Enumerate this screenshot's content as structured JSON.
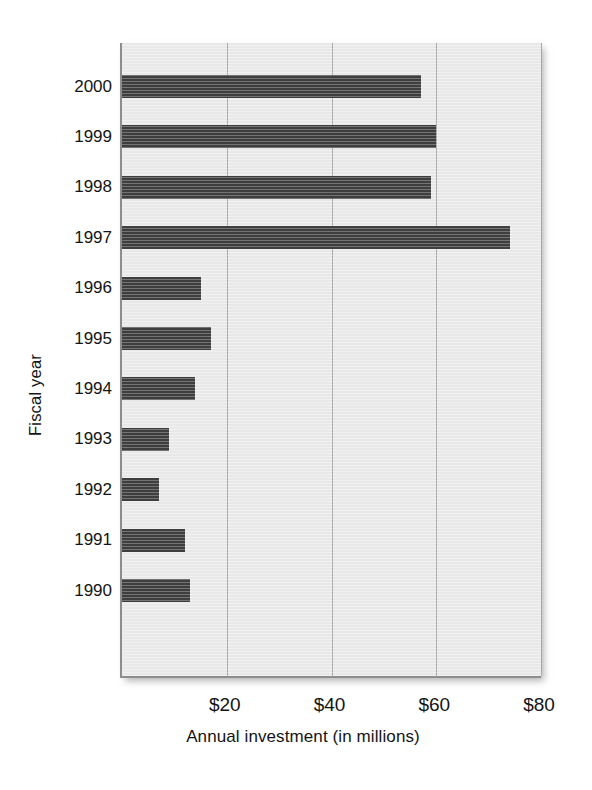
{
  "chart_data": {
    "type": "bar",
    "orientation": "horizontal",
    "title": "",
    "xlabel": "Annual investment (in millions)",
    "ylabel": "Fiscal year",
    "categories": [
      "2000",
      "1999",
      "1998",
      "1997",
      "1996",
      "1995",
      "1994",
      "1993",
      "1992",
      "1991",
      "1990"
    ],
    "values": [
      57,
      60,
      59,
      74,
      15,
      17,
      14,
      9,
      7,
      12,
      13
    ],
    "xlim": [
      0,
      80
    ],
    "xticks": [
      20,
      40,
      60,
      80
    ],
    "xtick_labels": [
      "$20",
      "$40",
      "$60",
      "$80"
    ],
    "grid": "vertical",
    "legend": "none",
    "bar_color": "#3f3f3f",
    "plot_background": "#ebebeb",
    "axis_color": "#8d8d8d",
    "gridline_color": "#a8a8a8"
  }
}
